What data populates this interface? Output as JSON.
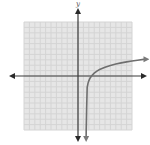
{
  "chart_data": {
    "type": "line",
    "title": "",
    "xlabel": "",
    "ylabel": "y",
    "xlim": [
      -10,
      10
    ],
    "ylim": [
      -10,
      10
    ],
    "grid": true,
    "grid_step": 1,
    "series": [
      {
        "name": "logarithmic curve",
        "description": "y = 1.3 ln(x - 1.5), vertical asymptote x = 1.5, x-intercept at x = 2.5",
        "vertical_asymptote": 1.5,
        "x_intercept": 2.5,
        "x": [
          1.52,
          1.55,
          1.6,
          1.7,
          1.85,
          2.0,
          2.25,
          2.5,
          3.0,
          3.5,
          4.0,
          5.0,
          6.0,
          7.0,
          8.0,
          9.0,
          10.0,
          11.0,
          12.5
        ],
        "y": [
          -10.0,
          -8.7,
          -6.0,
          -2.1,
          -1.36,
          -0.9,
          -0.37,
          0.0,
          0.53,
          0.9,
          1.19,
          1.63,
          1.96,
          2.22,
          2.43,
          2.62,
          2.78,
          2.93,
          3.12
        ]
      }
    ],
    "arrows": {
      "x_axis": "both ends",
      "y_axis": "both ends",
      "curve": "both ends"
    }
  }
}
